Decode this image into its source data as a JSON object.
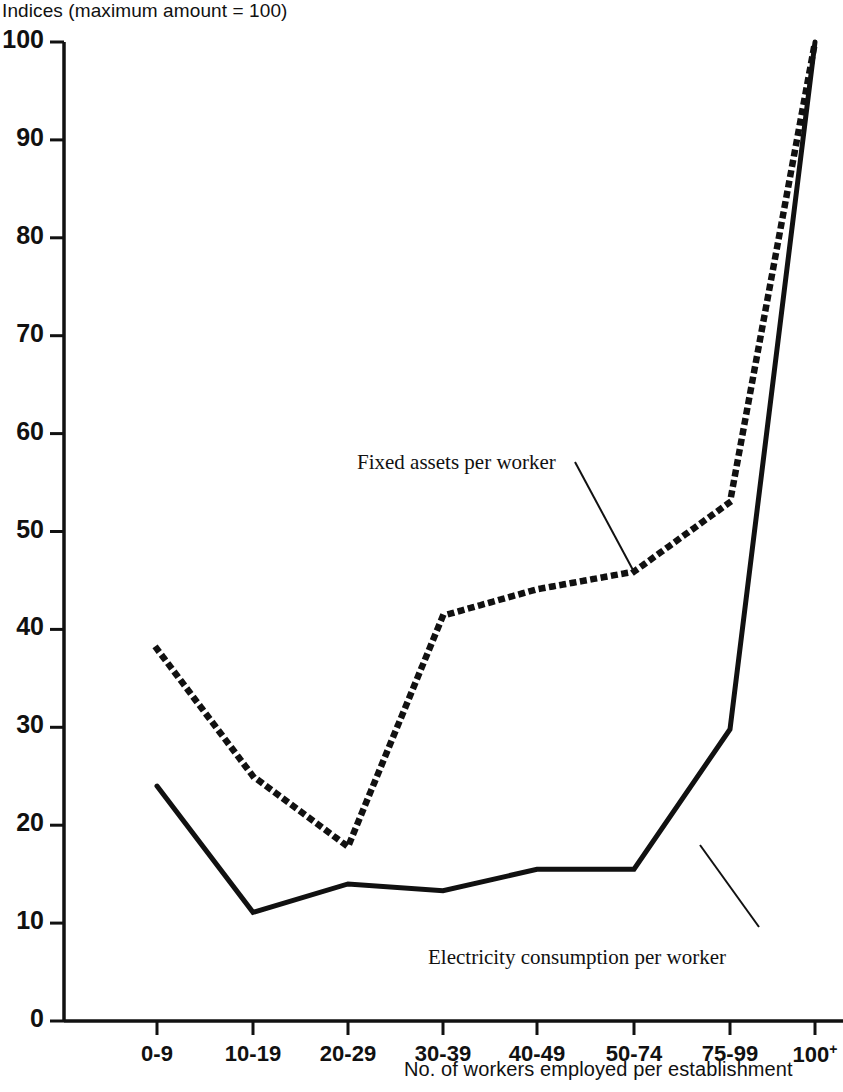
{
  "chart_data": {
    "type": "line",
    "title": "Indices (maximum amount = 100)",
    "xlabel": "No. of workers employed per establishment",
    "ylabel": "",
    "categories": [
      "0-9",
      "10-19",
      "20-29",
      "30-39",
      "40-49",
      "50-74",
      "75-99",
      "100+"
    ],
    "category_labels": [
      {
        "text": "0-9",
        "sup": ""
      },
      {
        "text": "10-19",
        "sup": ""
      },
      {
        "text": "20-29",
        "sup": ""
      },
      {
        "text": "30-39",
        "sup": ""
      },
      {
        "text": "40-49",
        "sup": ""
      },
      {
        "text": "50-74",
        "sup": ""
      },
      {
        "text": "75-99",
        "sup": ""
      },
      {
        "text": "100",
        "sup": "+"
      }
    ],
    "ylim": [
      0,
      100
    ],
    "xlim_categories": 8,
    "yticks": [
      0,
      10,
      20,
      30,
      40,
      50,
      60,
      70,
      80,
      90,
      100
    ],
    "ytick_labels": [
      "0",
      "10",
      "20",
      "30",
      "40",
      "50",
      "60",
      "70",
      "80",
      "90",
      "100"
    ],
    "grid": false,
    "legend_position": "inline-annotations",
    "series": [
      {
        "name": "Fixed assets per worker",
        "style": "dotted",
        "color": "#111111",
        "values": [
          38.0,
          25.0,
          17.8,
          41.4,
          44.1,
          45.9,
          53.0,
          100.0
        ]
      },
      {
        "name": "Electricity consumption per worker",
        "style": "solid",
        "color": "#111111",
        "values": [
          24.0,
          11.1,
          14.0,
          13.3,
          15.5,
          15.5,
          29.8,
          100.0
        ]
      }
    ],
    "annotations": [
      {
        "label": "Fixed assets per worker",
        "target_category": "50-74",
        "target_value": 45.9,
        "text_x": 357,
        "text_y": 450,
        "leader_from_x": 575,
        "leader_from_y": 462,
        "leader_to_x": 633,
        "leader_to_y": 570
      },
      {
        "label": "Electricity consumption per worker",
        "target_category": "75-99",
        "target_value": 21.5,
        "text_x": 428,
        "text_y": 945,
        "leader_from_x": 700,
        "leader_from_y": 845,
        "leader_to_x": 759,
        "leader_to_y": 927
      }
    ]
  },
  "axes": {
    "title": "Indices (maximum amount = 100)",
    "x_axis_title": "No. of workers employed per establishment"
  }
}
